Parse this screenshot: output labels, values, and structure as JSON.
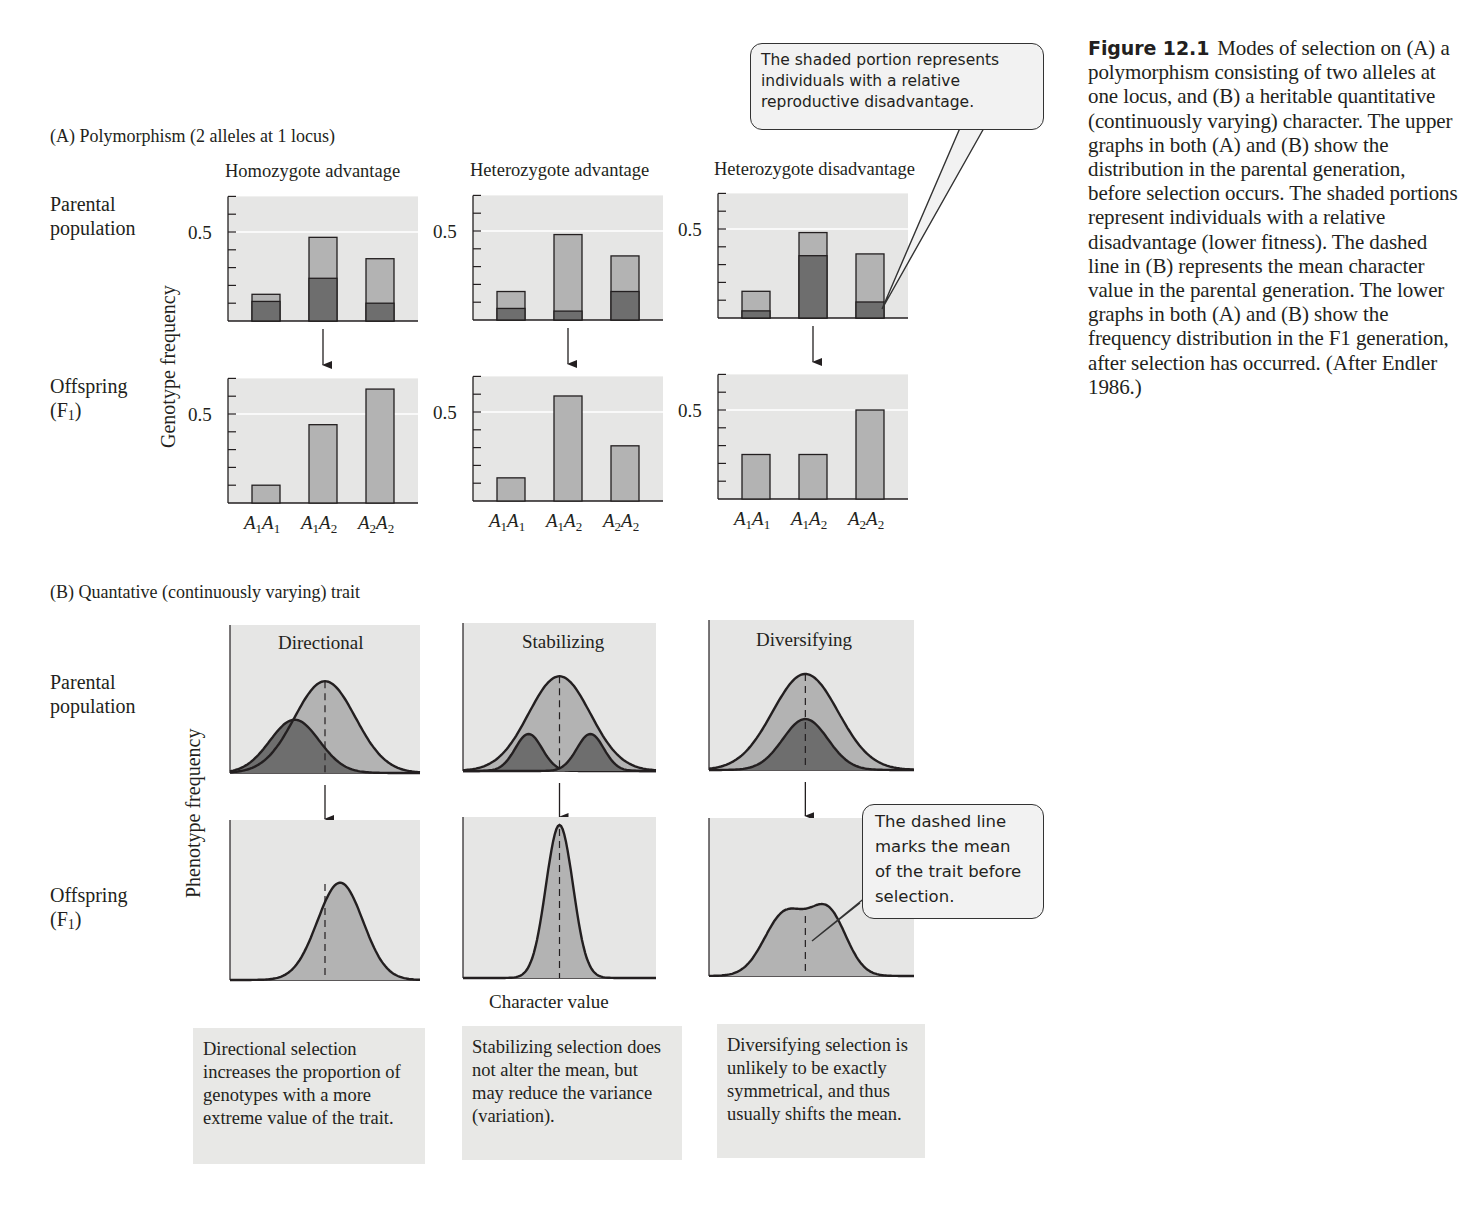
{
  "caption": {
    "figure_number": "Figure 12.1",
    "text": "Modes of selection on (A) a polymorphism consisting of two alleles at one locus, and (B) a heritable quantitative (continuously varying) character. The upper graphs in both (A) and (B) show the distribution in the parental generation, before selection occurs. The shaded portions represent individuals with a relative disadvantage (lower fitness). The dashed line in (B) represents the mean character value in the parental generation. The lower graphs in both (A) and (B) show the frequency distribution in the F1 generation, after selection has occurred. (After Endler 1986.)"
  },
  "callouts": {
    "top": "The shaded portion represents individuals with a relative reproductive disadvantage.",
    "bottom": "The dashed line marks the mean of the trait before selection."
  },
  "section_a": {
    "title": "(A)  Polymorphism (2 alleles at 1 locus)",
    "row_parental": [
      "Parental",
      "population"
    ],
    "row_offspring": [
      "Offspring",
      "(F",
      "1",
      ")"
    ],
    "y_axis_label": "Genotype frequency",
    "tick_label": "0.5",
    "panels": [
      {
        "title": "Homozygote advantage"
      },
      {
        "title": "Heterozygote advantage"
      },
      {
        "title": "Heterozygote disadvantage"
      }
    ]
  },
  "section_b": {
    "title": "(B)  Quantative (continuously varying) trait",
    "row_parental": [
      "Parental",
      "population"
    ],
    "row_offspring": [
      "Offspring",
      "(F",
      "1",
      ")"
    ],
    "y_axis_label": "Phenotype frequency",
    "x_axis_label": "Character value",
    "panels": [
      {
        "title": "Directional",
        "note": "Directional selection increases the proportion of genotypes with a more extreme value of the trait."
      },
      {
        "title": "Stabilizing",
        "note": "Stabilizing selection does not alter the mean, but may reduce the variance (variation)."
      },
      {
        "title": "Diversifying",
        "note": "Diversifying selection is unlikely to be exactly symmetrical, and thus usually shifts the mean."
      }
    ]
  },
  "colors": {
    "panel_bg": "#e6e6e5",
    "bar_light": "#b3b3b3",
    "bar_dark": "#6e6e6e",
    "outline": "#231f20"
  },
  "chart_data": [
    {
      "type": "bar",
      "title": "Homozygote advantage",
      "categories": [
        "A1A1",
        "A1A2",
        "A2A2"
      ],
      "ylabel": "Genotype frequency",
      "ylim": [
        0,
        0.7
      ],
      "yticks_labeled": [
        0.5
      ],
      "series": [
        {
          "name": "Parental total",
          "values": [
            0.15,
            0.47,
            0.35
          ]
        },
        {
          "name": "Parental shaded (disadvantaged)",
          "values": [
            0.11,
            0.24,
            0.1
          ]
        },
        {
          "name": "Offspring (F1)",
          "values": [
            0.1,
            0.44,
            0.64
          ]
        }
      ]
    },
    {
      "type": "bar",
      "title": "Heterozygote advantage",
      "categories": [
        "A1A1",
        "A1A2",
        "A2A2"
      ],
      "ylabel": "Genotype frequency",
      "ylim": [
        0,
        0.7
      ],
      "yticks_labeled": [
        0.5
      ],
      "series": [
        {
          "name": "Parental total",
          "values": [
            0.16,
            0.48,
            0.36
          ]
        },
        {
          "name": "Parental shaded (disadvantaged)",
          "values": [
            0.065,
            0.05,
            0.16
          ]
        },
        {
          "name": "Offspring (F1)",
          "values": [
            0.13,
            0.59,
            0.31
          ]
        }
      ]
    },
    {
      "type": "bar",
      "title": "Heterozygote disadvantage",
      "categories": [
        "A1A1",
        "A1A2",
        "A2A2"
      ],
      "ylabel": "Genotype frequency",
      "ylim": [
        0,
        0.7
      ],
      "yticks_labeled": [
        0.5
      ],
      "series": [
        {
          "name": "Parental total",
          "values": [
            0.15,
            0.48,
            0.36
          ]
        },
        {
          "name": "Parental shaded (disadvantaged)",
          "values": [
            0.04,
            0.35,
            0.09
          ]
        },
        {
          "name": "Offspring (F1)",
          "values": [
            0.25,
            0.25,
            0.5
          ]
        }
      ]
    },
    {
      "type": "area",
      "title": "Directional",
      "xlabel": "Character value",
      "ylabel": "Phenotype frequency",
      "series": [
        {
          "name": "Parental",
          "shape": "normal",
          "mean": 0.5,
          "sd": 0.16,
          "height": 0.62
        },
        {
          "name": "Parental shaded",
          "shape": "normal",
          "mean": 0.34,
          "sd": 0.13,
          "height": 0.36
        },
        {
          "name": "Offspring (F1)",
          "shape": "normal",
          "mean": 0.58,
          "sd": 0.12,
          "height": 0.64
        }
      ],
      "dashed_mean": 0.5
    },
    {
      "type": "area",
      "title": "Stabilizing",
      "xlabel": "Character value",
      "ylabel": "Phenotype frequency",
      "series": [
        {
          "name": "Parental",
          "shape": "normal",
          "mean": 0.5,
          "sd": 0.16,
          "height": 0.64
        },
        {
          "name": "Parental shaded (left tail)",
          "shape": "normal",
          "mean": 0.34,
          "sd": 0.07,
          "height": 0.25
        },
        {
          "name": "Parental shaded (right tail)",
          "shape": "normal",
          "mean": 0.66,
          "sd": 0.07,
          "height": 0.25
        },
        {
          "name": "Offspring (F1)",
          "shape": "normal",
          "mean": 0.5,
          "sd": 0.07,
          "height": 1.0
        }
      ],
      "dashed_mean": 0.5
    },
    {
      "type": "area",
      "title": "Diversifying",
      "xlabel": "Character value",
      "ylabel": "Phenotype frequency",
      "series": [
        {
          "name": "Parental",
          "shape": "normal",
          "mean": 0.47,
          "sd": 0.16,
          "height": 0.64
        },
        {
          "name": "Parental shaded (center)",
          "shape": "normal",
          "mean": 0.47,
          "sd": 0.11,
          "height": 0.34
        },
        {
          "name": "Offspring (F1)",
          "shape": "bimodal",
          "peaks": [
            0.38,
            0.56
          ],
          "height": 0.43
        }
      ],
      "dashed_mean": 0.47
    }
  ]
}
